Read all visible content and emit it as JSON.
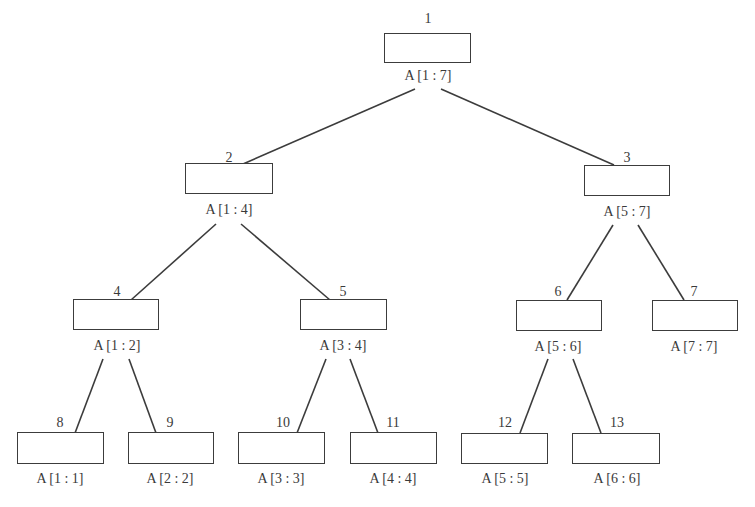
{
  "diagram": {
    "type": "segment-tree",
    "nodes": [
      {
        "id": "1",
        "label": "A [1 : 7]",
        "box": [
          384,
          33,
          87,
          30
        ],
        "num_pos": [
          428,
          12
        ],
        "label_pos": [
          428,
          69
        ]
      },
      {
        "id": "2",
        "label": "A [1 : 4]",
        "box": [
          185,
          163,
          88,
          31
        ],
        "num_pos": [
          229,
          151
        ],
        "label_pos": [
          229,
          203
        ]
      },
      {
        "id": "3",
        "label": "A [5 : 7]",
        "box": [
          584,
          165,
          86,
          31
        ],
        "num_pos": [
          627,
          151
        ],
        "label_pos": [
          627,
          205
        ]
      },
      {
        "id": "4",
        "label": "A [1 : 2]",
        "box": [
          73,
          299,
          86,
          31
        ],
        "num_pos": [
          117,
          285
        ],
        "label_pos": [
          117,
          339
        ]
      },
      {
        "id": "5",
        "label": "A [3 : 4]",
        "box": [
          300,
          299,
          87,
          31
        ],
        "num_pos": [
          343,
          285
        ],
        "label_pos": [
          343,
          339
        ]
      },
      {
        "id": "6",
        "label": "A [5 : 6]",
        "box": [
          516,
          300,
          86,
          31
        ],
        "num_pos": [
          558,
          285
        ],
        "label_pos": [
          558,
          340
        ]
      },
      {
        "id": "7",
        "label": "A [7 : 7]",
        "box": [
          652,
          300,
          86,
          31
        ],
        "num_pos": [
          694,
          285
        ],
        "label_pos": [
          694,
          340
        ]
      },
      {
        "id": "8",
        "label": "A [1 : 1]",
        "box": [
          17,
          432,
          87,
          32
        ],
        "num_pos": [
          60,
          416
        ],
        "label_pos": [
          60,
          472
        ]
      },
      {
        "id": "9",
        "label": "A [2 : 2]",
        "box": [
          128,
          432,
          86,
          32
        ],
        "num_pos": [
          170,
          416
        ],
        "label_pos": [
          170,
          472
        ]
      },
      {
        "id": "10",
        "label": "A [3 : 3]",
        "box": [
          238,
          432,
          87,
          32
        ],
        "num_pos": [
          283,
          416
        ],
        "label_pos": [
          281,
          472
        ]
      },
      {
        "id": "11",
        "label": "A [4 : 4]",
        "box": [
          350,
          432,
          87,
          32
        ],
        "num_pos": [
          393,
          416
        ],
        "label_pos": [
          393,
          472
        ]
      },
      {
        "id": "12",
        "label": "A [5 : 5]",
        "box": [
          461,
          433,
          87,
          31
        ],
        "num_pos": [
          505,
          416
        ],
        "label_pos": [
          505,
          472
        ]
      },
      {
        "id": "13",
        "label": "A [6 : 6]",
        "box": [
          572,
          433,
          88,
          31
        ],
        "num_pos": [
          617,
          416
        ],
        "label_pos": [
          617,
          472
        ]
      }
    ],
    "edges": [
      {
        "from": "1",
        "to": "2",
        "line": [
          415,
          89,
          243,
          164
        ]
      },
      {
        "from": "1",
        "to": "3",
        "line": [
          441,
          89,
          614,
          165
        ]
      },
      {
        "from": "2",
        "to": "4",
        "line": [
          216,
          224,
          131,
          300
        ]
      },
      {
        "from": "2",
        "to": "5",
        "line": [
          241,
          224,
          330,
          300
        ]
      },
      {
        "from": "3",
        "to": "6",
        "line": [
          613,
          225,
          567,
          300
        ]
      },
      {
        "from": "3",
        "to": "7",
        "line": [
          638,
          225,
          684,
          300
        ]
      },
      {
        "from": "4",
        "to": "8",
        "line": [
          103,
          359,
          75,
          433
        ]
      },
      {
        "from": "4",
        "to": "9",
        "line": [
          129,
          359,
          156,
          433
        ]
      },
      {
        "from": "5",
        "to": "10",
        "line": [
          326,
          359,
          297,
          433
        ]
      },
      {
        "from": "5",
        "to": "11",
        "line": [
          350,
          359,
          378,
          433
        ]
      },
      {
        "from": "6",
        "to": "12",
        "line": [
          548,
          359,
          520,
          433
        ]
      },
      {
        "from": "6",
        "to": "13",
        "line": [
          573,
          359,
          601,
          433
        ]
      }
    ],
    "colors": {
      "stroke": "#3c3c3c",
      "text": "#3a3a3a",
      "background": "#ffffff"
    }
  }
}
